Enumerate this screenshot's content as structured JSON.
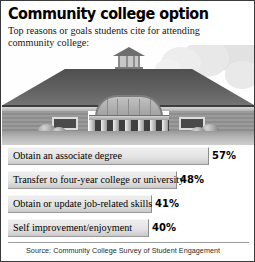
{
  "headline": "Community college option",
  "subhead": "Top reasons or goals students cite for attending community college:",
  "illustration": {
    "name": "community-college-building-photo",
    "description": "Grayscale photo of a one-story brick community college building with a wide hipped roof, rooftop cupola, arched colonnaded entrance, side windows and shrubs, against a cloudy sky"
  },
  "source": "Source: Community College Survey of Student Engagement",
  "chart_data": {
    "type": "bar",
    "title": "Community college option",
    "subtitle": "Top reasons or goals students cite for attending community college:",
    "orientation": "horizontal",
    "categories": [
      "Obtain an associate degree",
      "Transfer to four-year college or university",
      "Obtain or update job-related skills",
      "Self improvement/enjoyment"
    ],
    "values": [
      57,
      48,
      41,
      40
    ],
    "value_labels": [
      "57%",
      "48%",
      "41%",
      "40%"
    ],
    "unit": "%",
    "xlabel": "",
    "ylabel": "",
    "xlim": [
      0,
      63
    ],
    "grid": false,
    "legend": false,
    "bar_color": "#e4e4e4",
    "text_color": "#000000"
  }
}
